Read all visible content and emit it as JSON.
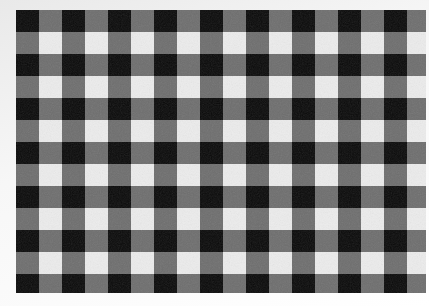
{
  "image": {
    "subject": "black and white gingham checkered fabric",
    "pattern": "gingham",
    "colors": {
      "background": "#f4f4f4",
      "dark": "#0a0a0a",
      "mid": "#6e6e6e",
      "light": "#ececec"
    },
    "grid": {
      "cell_width": 23,
      "cell_height": 22,
      "columns": 18,
      "rows": 13
    }
  }
}
